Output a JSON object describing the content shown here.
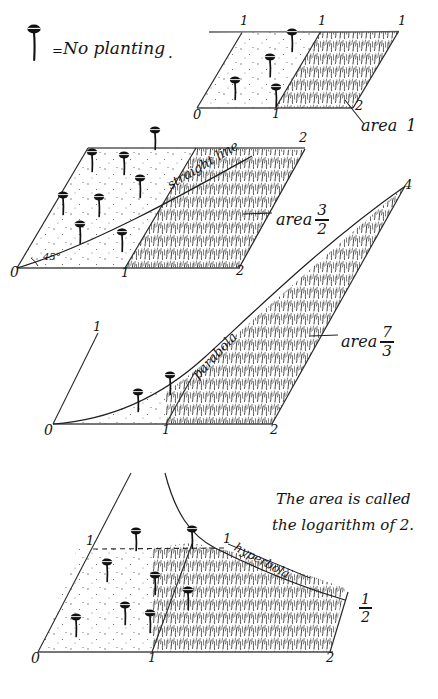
{
  "page": {
    "background_color": "#ffffff",
    "ink_color": "#141414"
  },
  "legend": {
    "icon_name": "nail-icon",
    "equals_sign": "=",
    "text": "No planting",
    "period": "."
  },
  "panels": [
    {
      "id": "panel-1",
      "curve_label": "",
      "area_label": "area",
      "area_value": "1",
      "area_numerator": "",
      "area_denominator": "",
      "axis_labels_bottom": [
        "0",
        "1",
        "2"
      ],
      "axis_labels_top": [
        "1",
        "1",
        "1"
      ],
      "angle_label": "",
      "nail_count": 4
    },
    {
      "id": "panel-2",
      "curve_label": "straight line",
      "area_label": "area",
      "area_value": "",
      "area_numerator": "3",
      "area_denominator": "2",
      "axis_labels_bottom": [
        "0",
        "1",
        "2"
      ],
      "axis_labels_top": [
        "2",
        "2"
      ],
      "angle_label": "45°",
      "nail_count": 8
    },
    {
      "id": "panel-3",
      "curve_label": "parabola",
      "area_label": "area",
      "area_value": "",
      "area_numerator": "7",
      "area_denominator": "3",
      "axis_labels_bottom": [
        "0",
        "1",
        "2"
      ],
      "axis_labels_top": [
        "1",
        "4"
      ],
      "angle_label": "",
      "nail_count": 2
    },
    {
      "id": "panel-4",
      "curve_label": "hyperbola",
      "area_label": "",
      "area_value": "",
      "area_numerator": "1",
      "area_denominator": "2",
      "axis_labels_bottom": [
        "0",
        "1",
        "2"
      ],
      "axis_labels_top": [
        "1",
        "1"
      ],
      "angle_label": "",
      "caption_line1": "The area is called",
      "caption_line2": "the logarithm of 2.",
      "nail_count": 8
    }
  ]
}
